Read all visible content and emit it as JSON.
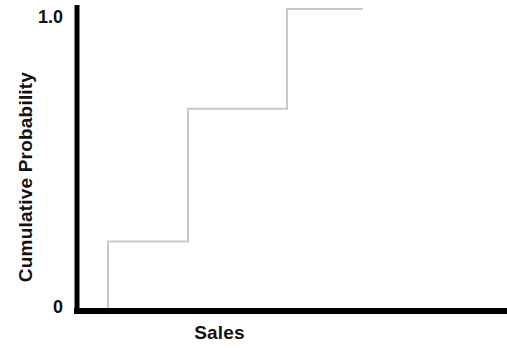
{
  "chart_data": {
    "type": "line",
    "subtype": "step-ecdf",
    "title": "",
    "xlabel": "Sales",
    "ylabel": "Cumulative Probability",
    "x_tick_labels": [],
    "y_tick_labels": [
      "0",
      "1.0"
    ],
    "ylim": [
      0,
      1.0
    ],
    "grid": false,
    "legend": null,
    "line_color": "#c9c9c9",
    "axis_color": "#000000",
    "background_color": "#ffffff",
    "step_mode": "post",
    "x": [
      1,
      2,
      3
    ],
    "y": [
      0.23,
      0.67,
      1.0
    ],
    "steps": [
      {
        "level_label": "0.23",
        "value": 0.23,
        "x_start": 1,
        "x_end": 2
      },
      {
        "level_label": "0.67",
        "value": 0.67,
        "x_start": 2,
        "x_end": 3
      },
      {
        "level_label": "1.0",
        "value": 1.0,
        "x_start": 3,
        "x_end": 4
      }
    ]
  },
  "axis": {
    "y_max_label": "1.0",
    "y_min_label": "0",
    "x_title": "Sales",
    "y_title": "Cumulative Probability"
  }
}
